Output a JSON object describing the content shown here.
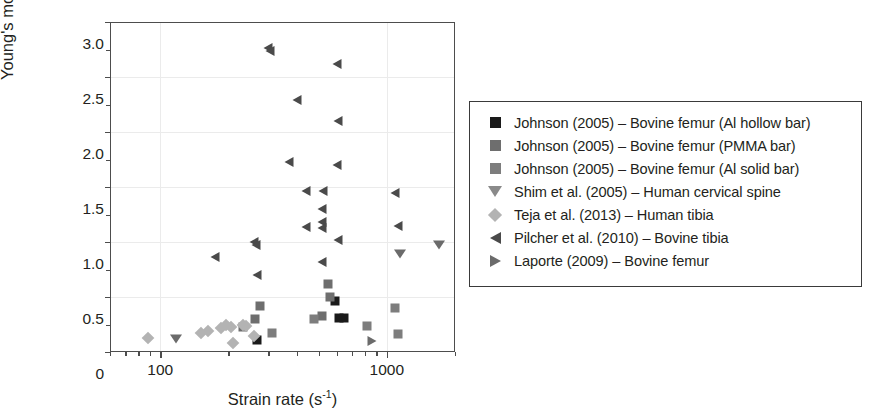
{
  "chart_data": {
    "type": "scatter",
    "title": "",
    "xlabel": "Strain rate (s⁻¹)",
    "ylabel": "Young's modulus (GPa)",
    "xscale": "log",
    "yscale": "linear",
    "xlim": [
      60,
      2000
    ],
    "ylim": [
      0,
      3.0
    ],
    "grid": true,
    "legend_position": "right-outside",
    "xticks_major": [
      100,
      1000
    ],
    "xtick_labels": [
      "100",
      "1000"
    ],
    "yticks_major": [
      0,
      0.5,
      1.0,
      1.5,
      2.0,
      2.5,
      3.0
    ],
    "ytick_labels": [
      "0",
      "0.5",
      "1.0",
      "1.5",
      "2.0",
      "2.5",
      "3.0"
    ],
    "yticks_minor": [
      0.25,
      0.75,
      1.25,
      1.75,
      2.25,
      2.75
    ],
    "series": [
      {
        "name": "Johnson (2005) – Bovine femur (Al hollow bar)",
        "marker": "square",
        "color": "#1a1a1a",
        "points": [
          {
            "x": 268,
            "y": 0.11
          },
          {
            "x": 615,
            "y": 0.31
          },
          {
            "x": 648,
            "y": 0.31
          },
          {
            "x": 590,
            "y": 0.46
          }
        ]
      },
      {
        "name": "Johnson (2005) – Bovine femur (PMMA bar)",
        "marker": "square",
        "color": "#6e6e6e",
        "points": [
          {
            "x": 232,
            "y": 0.23
          },
          {
            "x": 262,
            "y": 0.3
          },
          {
            "x": 276,
            "y": 0.42
          },
          {
            "x": 520,
            "y": 0.33
          },
          {
            "x": 552,
            "y": 0.62
          },
          {
            "x": 560,
            "y": 0.5
          }
        ]
      },
      {
        "name": "Johnson (2005) – Bovine femur (Al solid bar)",
        "marker": "square",
        "color": "#7d7d7d",
        "points": [
          {
            "x": 310,
            "y": 0.17
          },
          {
            "x": 478,
            "y": 0.3
          },
          {
            "x": 815,
            "y": 0.24
          },
          {
            "x": 1120,
            "y": 0.16
          },
          {
            "x": 1090,
            "y": 0.4
          }
        ]
      },
      {
        "name": "Shim et al. (2005) – Human cervical spine",
        "marker": "triangle-down",
        "color": "#6b6b6b",
        "points": [
          {
            "x": 117,
            "y": 0.12
          },
          {
            "x": 1140,
            "y": 0.89
          },
          {
            "x": 1700,
            "y": 0.97
          }
        ]
      },
      {
        "name": "Teja et al. (2013) – Human tibia",
        "marker": "diamond",
        "color": "#b3b3b3",
        "points": [
          {
            "x": 88,
            "y": 0.13
          },
          {
            "x": 152,
            "y": 0.17
          },
          {
            "x": 163,
            "y": 0.19
          },
          {
            "x": 186,
            "y": 0.22
          },
          {
            "x": 196,
            "y": 0.25
          },
          {
            "x": 205,
            "y": 0.23
          },
          {
            "x": 210,
            "y": 0.08
          },
          {
            "x": 232,
            "y": 0.25
          },
          {
            "x": 240,
            "y": 0.24
          },
          {
            "x": 258,
            "y": 0.15
          }
        ]
      },
      {
        "name": "Pilcher et al. (2010) – Bovine tibia",
        "marker": "triangle-left",
        "color": "#4a4a4a",
        "points": [
          {
            "x": 300,
            "y": 2.76
          },
          {
            "x": 305,
            "y": 2.74
          },
          {
            "x": 600,
            "y": 2.62
          },
          {
            "x": 400,
            "y": 2.29
          },
          {
            "x": 610,
            "y": 2.1
          },
          {
            "x": 370,
            "y": 1.73
          },
          {
            "x": 600,
            "y": 1.7
          },
          {
            "x": 174,
            "y": 0.86
          },
          {
            "x": 258,
            "y": 1.0
          },
          {
            "x": 264,
            "y": 0.97
          },
          {
            "x": 267,
            "y": 0.7
          },
          {
            "x": 440,
            "y": 1.46
          },
          {
            "x": 525,
            "y": 1.46
          },
          {
            "x": 520,
            "y": 1.3
          },
          {
            "x": 515,
            "y": 1.18
          },
          {
            "x": 520,
            "y": 1.13
          },
          {
            "x": 440,
            "y": 1.14
          },
          {
            "x": 608,
            "y": 1.02
          },
          {
            "x": 520,
            "y": 0.82
          },
          {
            "x": 1090,
            "y": 1.45
          },
          {
            "x": 1120,
            "y": 1.15
          }
        ]
      },
      {
        "name": "Laporte (2009) – Bovine femur",
        "marker": "triangle-right",
        "color": "#6b6b6b",
        "points": [
          {
            "x": 860,
            "y": 0.1
          }
        ]
      }
    ]
  },
  "legend": {
    "items": [
      {
        "label": "Johnson (2005) – Bovine femur (Al hollow bar)",
        "marker": "square",
        "color": "#1a1a1a"
      },
      {
        "label": "Johnson (2005) – Bovine femur (PMMA bar)",
        "marker": "square",
        "color": "#6e6e6e"
      },
      {
        "label": "Johnson (2005) – Bovine femur (Al solid bar)",
        "marker": "square",
        "color": "#7d7d7d"
      },
      {
        "label": "Shim et al. (2005) – Human cervical spine",
        "marker": "triangle-down",
        "color": "#8a8a8a"
      },
      {
        "label": "Teja et al. (2013) – Human tibia",
        "marker": "diamond",
        "color": "#b3b3b3"
      },
      {
        "label": "Pilcher et al. (2010) – Bovine tibia",
        "marker": "triangle-left",
        "color": "#4a4a4a"
      },
      {
        "label": "Laporte (2009) – Bovine femur",
        "marker": "triangle-right",
        "color": "#6b6b6b"
      }
    ]
  },
  "axes": {
    "x_title_main": "Strain rate (s",
    "x_title_sup": "-1",
    "x_title_tail": ")",
    "y_title": "Young's modulus (GPa)"
  }
}
